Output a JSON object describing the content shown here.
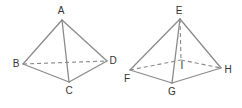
{
  "figures": [
    {
      "name": "tetrahedron",
      "vertices": {
        "A": {
          "label": "A",
          "x": 62,
          "y": 20,
          "lx": 61,
          "ly": 11
        },
        "B": {
          "label": "B",
          "x": 23,
          "y": 64,
          "lx": 16,
          "ly": 64
        },
        "C": {
          "label": "C",
          "x": 69,
          "y": 82,
          "lx": 69,
          "ly": 91
        },
        "D": {
          "label": "D",
          "x": 107,
          "y": 61,
          "lx": 113,
          "ly": 61
        }
      },
      "edges": [
        [
          "A",
          "B"
        ],
        [
          "A",
          "C"
        ],
        [
          "A",
          "D"
        ],
        [
          "B",
          "C"
        ],
        [
          "C",
          "D"
        ]
      ],
      "hidden_edges": [
        [
          "B",
          "D"
        ]
      ]
    },
    {
      "name": "square-pyramid",
      "vertices": {
        "E": {
          "label": "E",
          "x": 180,
          "y": 19,
          "lx": 179,
          "ly": 11
        },
        "F": {
          "label": "F",
          "x": 130,
          "y": 70,
          "lx": 127,
          "ly": 79
        },
        "G": {
          "label": "G",
          "x": 172,
          "y": 83,
          "lx": 172,
          "ly": 92
        },
        "H": {
          "label": "H",
          "x": 221,
          "y": 68,
          "lx": 228,
          "ly": 70
        },
        "I": {
          "label": "I",
          "x": 181,
          "y": 60,
          "lx": 182,
          "ly": 66
        }
      },
      "edges": [
        [
          "E",
          "F"
        ],
        [
          "E",
          "G"
        ],
        [
          "E",
          "H"
        ],
        [
          "F",
          "G"
        ],
        [
          "G",
          "H"
        ]
      ],
      "hidden_edges": [
        [
          "F",
          "I"
        ],
        [
          "I",
          "H"
        ],
        [
          "E",
          "I"
        ]
      ]
    }
  ]
}
